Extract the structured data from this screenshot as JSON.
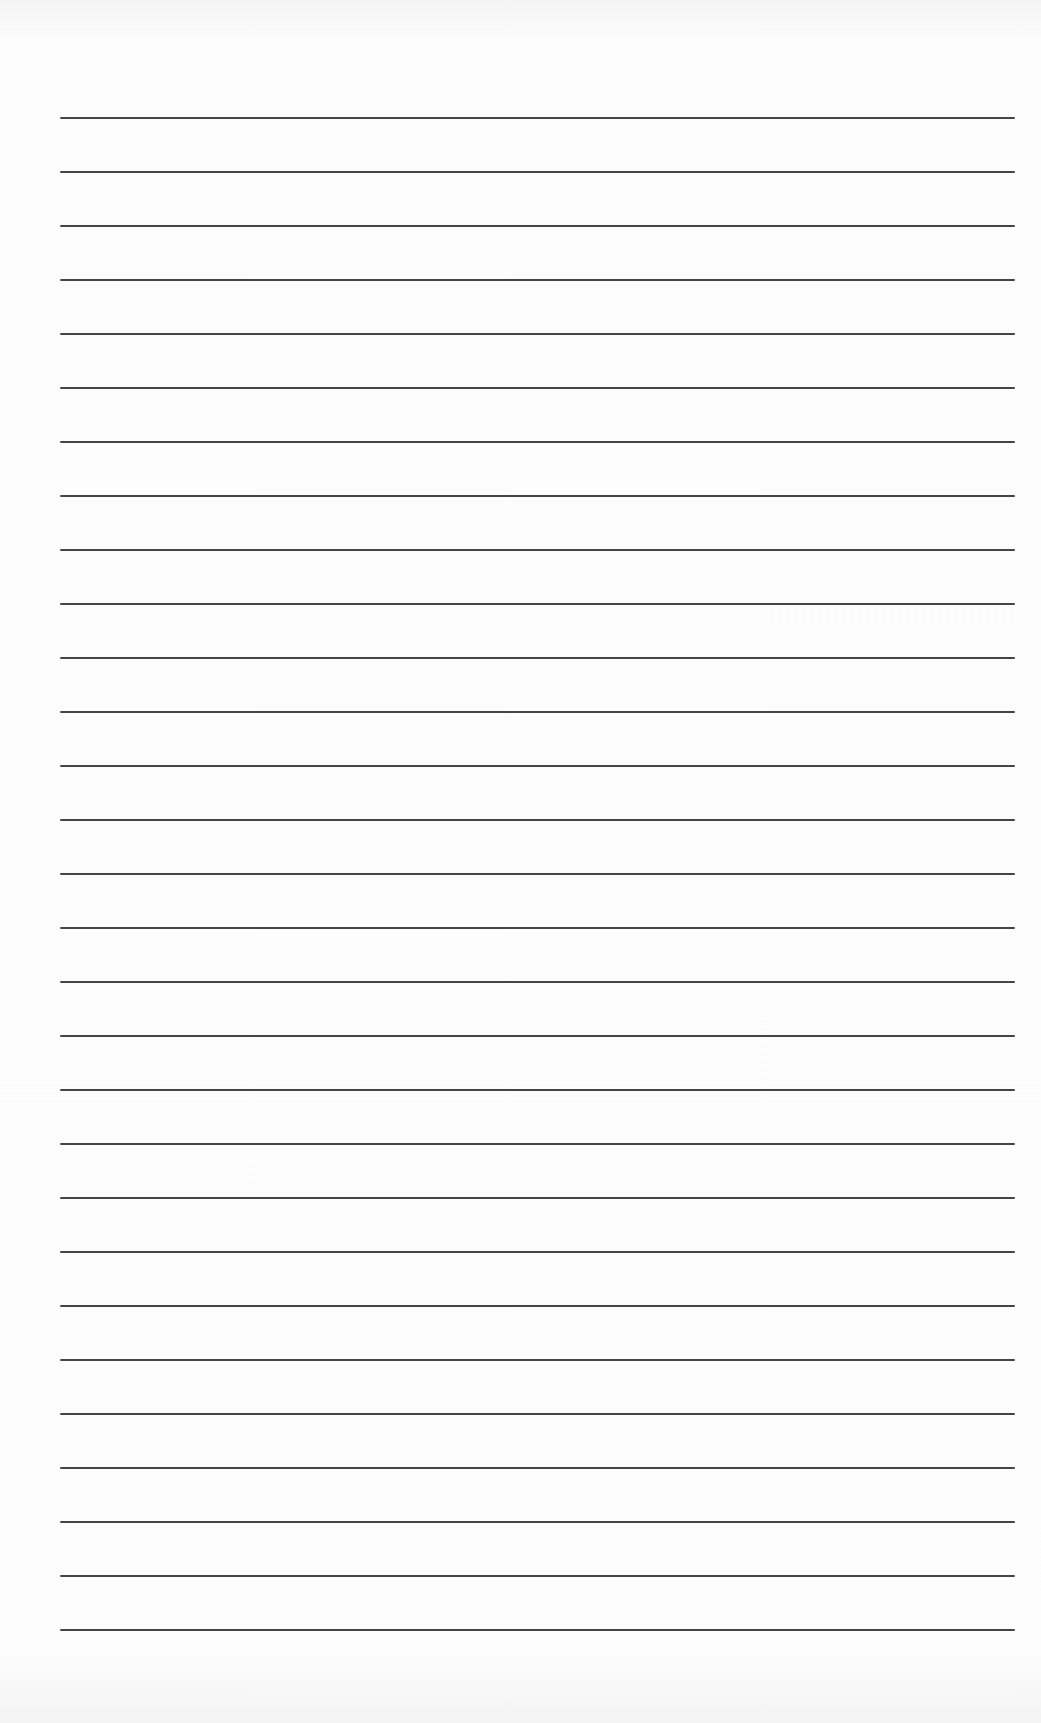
{
  "page": {
    "type": "lined-paper",
    "background_color": "#fbfbfb",
    "rule_color": "#454545",
    "rule_count": 29,
    "rule_first_y": 117,
    "rule_spacing": 54,
    "rule_left": 60,
    "rule_right": 1015,
    "rule_thickness": 2
  }
}
